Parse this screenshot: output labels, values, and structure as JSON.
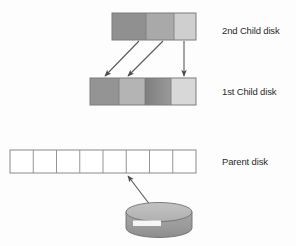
{
  "diagram": {
    "background_color": "#fdfdfd"
  },
  "labels": {
    "second_child": "2nd Child disk",
    "first_child": "1st Child disk",
    "parent": "Parent disk"
  },
  "bars": {
    "second_child_disk": {
      "name": "2nd Child disk",
      "segment_count": 3,
      "border_color": "#7d7d7d",
      "segments": [
        {
          "index": 0,
          "fill": "#909090",
          "width_pct": 40
        },
        {
          "index": 1,
          "fill": "#a9a9a9",
          "width_pct": 33
        },
        {
          "index": 2,
          "fill": "#cfcfcf",
          "width_pct": 27
        }
      ]
    },
    "first_child_disk": {
      "name": "1st Child disk",
      "segment_count": 4,
      "border_color": "#7d7d7d",
      "segments": [
        {
          "index": 0,
          "fill": "#949494",
          "width_pct": 27
        },
        {
          "index": 1,
          "fill": "#b4b4b4",
          "width_pct": 24
        },
        {
          "index": 2,
          "fill": "#8a8a8a",
          "width_pct": 25
        },
        {
          "index": 3,
          "fill": "#d8d8d8",
          "width_pct": 24
        }
      ]
    },
    "parent_disk": {
      "name": "Parent disk",
      "segment_count": 8,
      "border_color": "#8a8a8a",
      "fill": "#ffffff"
    }
  },
  "arrows": [
    {
      "id": "arrow-1",
      "from": "2nd-child-seg0-boundary",
      "to": "1st-child-seg0",
      "style": "diagonal"
    },
    {
      "id": "arrow-2",
      "from": "2nd-child-seg1-boundary",
      "to": "1st-child-seg1",
      "style": "diagonal"
    },
    {
      "id": "arrow-3",
      "from": "2nd-child-seg2",
      "to": "1st-child-seg3",
      "style": "vertical"
    },
    {
      "id": "arrow-4",
      "from": "storage-cylinder",
      "to": "parent-disk",
      "style": "diagonal"
    }
  ],
  "cylinder": {
    "name": "storage-cylinder",
    "top_fill": "#b9b9b9",
    "body_fill": "#9a9a9a",
    "stripe_fill": "#f4f4f4",
    "outline": "#6f6f6f"
  },
  "colors": {
    "stroke": "#5a5a5a",
    "text": "#2b2b2b",
    "background": "#fdfdfd"
  }
}
